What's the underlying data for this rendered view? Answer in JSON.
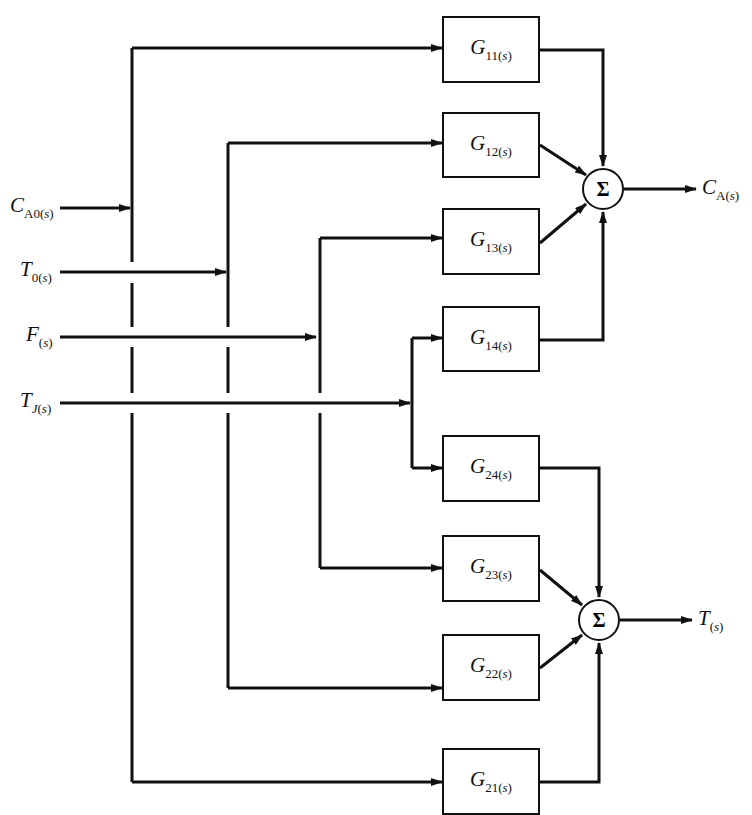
{
  "inputs": [
    {
      "main": "C",
      "sub": "A0",
      "arg": "s"
    },
    {
      "main": "T",
      "sub": "0",
      "arg": "s"
    },
    {
      "main": "F",
      "sub": "",
      "arg": "s"
    },
    {
      "main": "T",
      "sub": "J",
      "arg": "s"
    }
  ],
  "blocks": [
    {
      "main": "G",
      "sub": "11",
      "arg": "s"
    },
    {
      "main": "G",
      "sub": "12",
      "arg": "s"
    },
    {
      "main": "G",
      "sub": "13",
      "arg": "s"
    },
    {
      "main": "G",
      "sub": "14",
      "arg": "s"
    },
    {
      "main": "G",
      "sub": "24",
      "arg": "s"
    },
    {
      "main": "G",
      "sub": "23",
      "arg": "s"
    },
    {
      "main": "G",
      "sub": "22",
      "arg": "s"
    },
    {
      "main": "G",
      "sub": "21",
      "arg": "s"
    }
  ],
  "summers": [
    {
      "symbol": "Σ"
    },
    {
      "symbol": "Σ"
    }
  ],
  "outputs": [
    {
      "main": "C",
      "sub": "A",
      "arg": "s"
    },
    {
      "main": "T",
      "sub": "",
      "arg": "s"
    }
  ]
}
